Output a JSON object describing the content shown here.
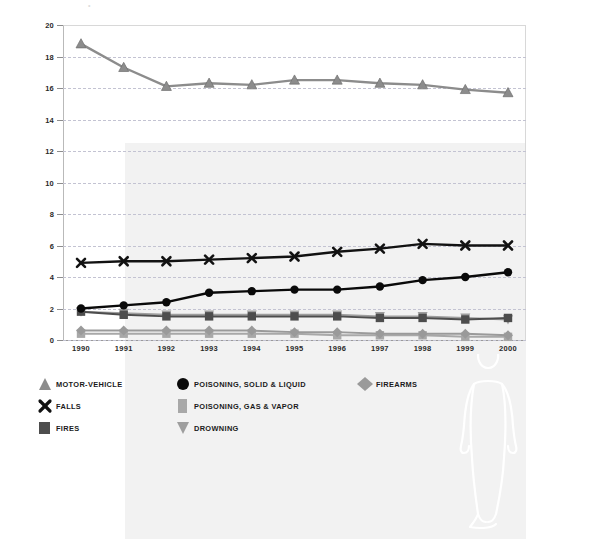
{
  "chart_data": {
    "type": "line",
    "title": "",
    "xlabel": "",
    "ylabel": "Deaths per 100,000 Population",
    "categories": [
      "1990",
      "1991",
      "1992",
      "1993",
      "1994",
      "1995",
      "1996",
      "1997",
      "1998",
      "1999",
      "2000"
    ],
    "x": [
      1990,
      1991,
      1992,
      1993,
      1994,
      1995,
      1996,
      1997,
      1998,
      1999,
      2000
    ],
    "ylim": [
      0,
      20
    ],
    "yticks": [
      0,
      2,
      4,
      6,
      8,
      10,
      12,
      14,
      16,
      18,
      20
    ],
    "ytick_labels": [
      "0",
      "2",
      "4",
      "6",
      "8",
      "10",
      "12",
      "14",
      "16",
      "18",
      "20"
    ],
    "grid": true,
    "grid_style": "horizontal-dashed",
    "legend_position": "below-plot",
    "series": [
      {
        "name": "MOTOR-VEHICLE",
        "marker": "triangle-up",
        "color": "#8c8c8c",
        "values": [
          18.8,
          17.3,
          16.1,
          16.3,
          16.2,
          16.5,
          16.5,
          16.3,
          16.2,
          15.9,
          15.7
        ]
      },
      {
        "name": "FALLS",
        "marker": "x",
        "color": "#121212",
        "values": [
          4.9,
          5.0,
          5.0,
          5.1,
          5.2,
          5.3,
          5.6,
          5.8,
          6.1,
          6.0,
          6.0
        ]
      },
      {
        "name": "FIRES",
        "marker": "square",
        "color": "#4d4d4d",
        "values": [
          1.8,
          1.6,
          1.5,
          1.5,
          1.5,
          1.5,
          1.5,
          1.4,
          1.4,
          1.3,
          1.4
        ]
      },
      {
        "name": "POISONING, SOLID & LIQUID",
        "marker": "circle",
        "color": "#0a0a0a",
        "values": [
          2.0,
          2.2,
          2.4,
          3.0,
          3.1,
          3.2,
          3.2,
          3.4,
          3.8,
          4.0,
          4.3
        ]
      },
      {
        "name": "POISONING, GAS & VAPOR",
        "marker": "square-light",
        "color": "#a8a8a8",
        "values": [
          0.4,
          0.4,
          0.4,
          0.4,
          0.4,
          0.4,
          0.3,
          0.3,
          0.3,
          0.2,
          0.2
        ]
      },
      {
        "name": "DROWNING",
        "marker": "triangle-down",
        "color": "#9e9e9e",
        "values": [
          1.8,
          1.7,
          1.6,
          1.6,
          1.6,
          1.6,
          1.6,
          1.5,
          1.5,
          1.4,
          1.3
        ]
      },
      {
        "name": "FIREARMS",
        "marker": "diamond",
        "color": "#9a9a9a",
        "values": [
          0.6,
          0.6,
          0.6,
          0.6,
          0.6,
          0.5,
          0.5,
          0.4,
          0.4,
          0.4,
          0.3
        ]
      }
    ],
    "legend_columns": [
      [
        "MOTOR-VEHICLE",
        "FALLS",
        "FIRES"
      ],
      [
        "POISONING, SOLID & LIQUID",
        "POISONING, GAS & VAPOR",
        "DROWNING"
      ],
      [
        "FIREARMS"
      ]
    ]
  },
  "colors": {
    "motor_vehicle": "#8c8c8c",
    "falls": "#121212",
    "fires": "#4d4d4d",
    "poisoning_solid": "#0a0a0a",
    "poisoning_gas": "#a8a8a8",
    "drowning": "#9e9e9e",
    "firearms": "#9a9a9a",
    "grid": "#c3c3d2",
    "panel": "#f2f2f2"
  }
}
